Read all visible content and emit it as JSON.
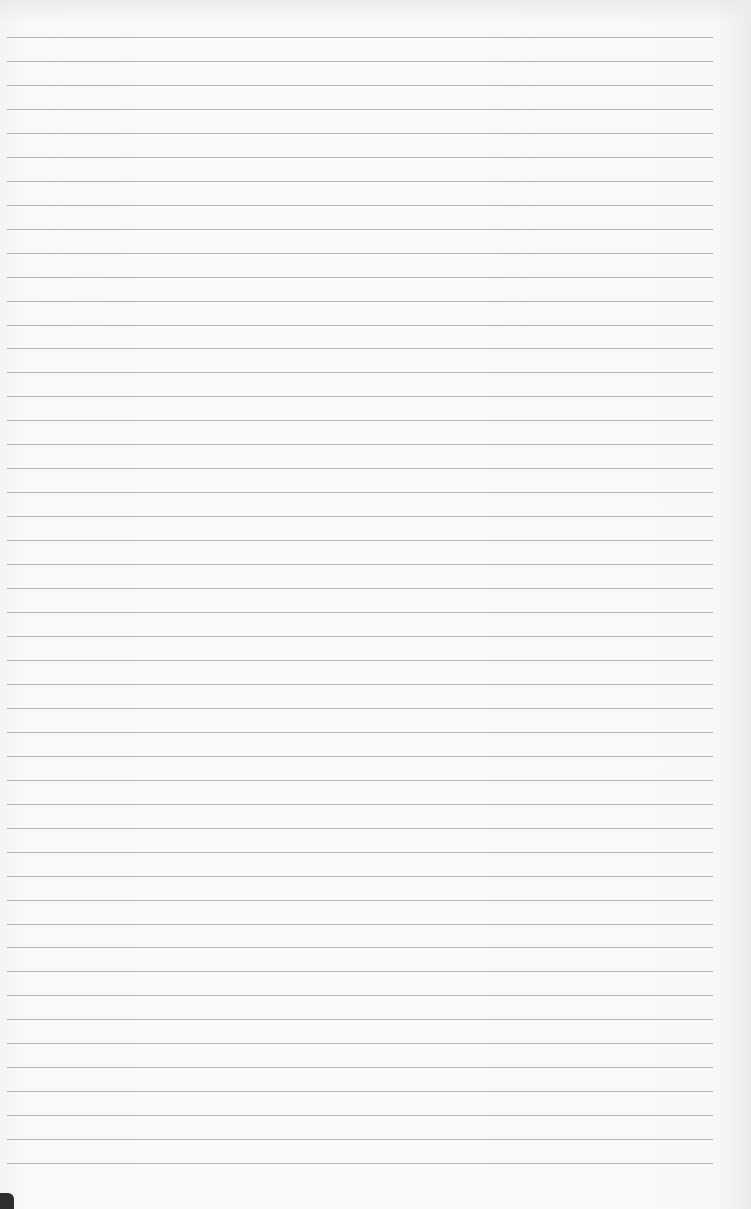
{
  "page": {
    "type": "lined-paper",
    "background_color": "#f7f7f5",
    "rule_color": "#a9a9a7",
    "rule_count": 48,
    "rule_first_y": 37,
    "rule_spacing": 23.96,
    "rule_left": 7,
    "rule_width": 706
  }
}
